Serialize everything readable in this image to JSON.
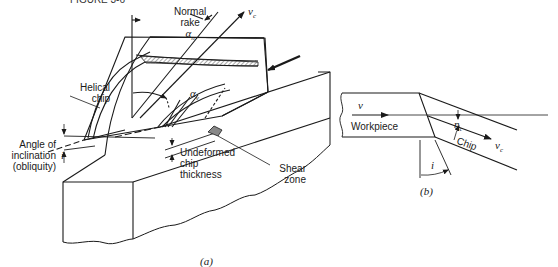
{
  "figure": {
    "header_fragment": "FIGURE 3-6",
    "panel_a": {
      "caption": "(a)",
      "labels": {
        "normal_rake_line1": "Normal",
        "normal_rake_line2": "rake",
        "normal_rake_symbol": "α",
        "normal_rake_sub": "n",
        "vc_symbol": "v",
        "vc_sub": "c",
        "helical_chip_line1": "Helical",
        "helical_chip_line2": "chip",
        "alpha_v_symbol": "α",
        "alpha_v_sub": "v",
        "angle_incl_line1": "Angle of",
        "angle_incl_line2": "inclination",
        "angle_incl_line3": "(obliquity)",
        "i_symbol": "i",
        "undeformed_line1": "Undeformed",
        "undeformed_line2": "chip",
        "undeformed_line3": "thickness",
        "shear_line1": "Shear",
        "shear_line2": "zone"
      }
    },
    "panel_b": {
      "caption": "(b)",
      "labels": {
        "v_symbol": "v",
        "workpiece": "Workpiece",
        "eta_symbol": "η",
        "eta_sub": "c",
        "chip": "Chip",
        "vc_symbol": "v",
        "vc_sub": "c",
        "i_symbol": "i"
      }
    },
    "colors": {
      "line": "#1a1a1a",
      "hatch": "#555555",
      "shear_fill": "#888888",
      "background": "#ffffff"
    }
  }
}
